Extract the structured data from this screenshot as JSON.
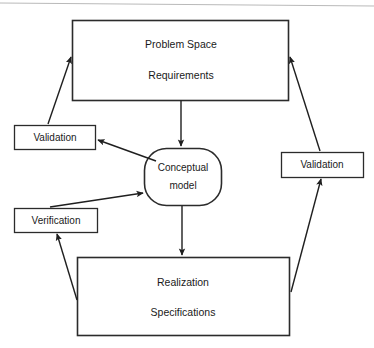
{
  "diagram": {
    "nodes": {
      "problem_space": {
        "line1": "Problem  Space",
        "line2": "Requirements"
      },
      "conceptual_model": {
        "line1": "Conceptual",
        "line2": "model"
      },
      "realization": {
        "line1": "Realization",
        "line2": "Specifications"
      },
      "validation_left": {
        "label": "Validation"
      },
      "validation_right": {
        "label": "Validation"
      },
      "verification": {
        "label": "Verification"
      }
    },
    "colors": {
      "stroke": "#2b2b2b",
      "edge": "#1f1f1f",
      "background": "#ffffff",
      "text": "#1a1a1a",
      "scan_rule": "#b9b9b9"
    }
  }
}
